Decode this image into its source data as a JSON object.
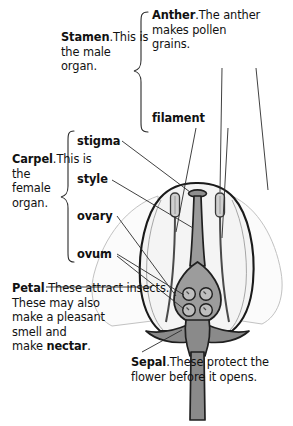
{
  "diagram": {
    "colors": {
      "outline": "#1a1a1a",
      "petal_fill": "#f2f2f2",
      "outer_petal": "#d8d8d8",
      "receptacle": "#8c8c8c",
      "ovary": "#9a9a9a",
      "ovule": "#8a8a8a",
      "anther": "#c9c9c9",
      "leader": "#2b2b2b",
      "background": "#ffffff"
    }
  },
  "labels": {
    "stamen": {
      "term": "Stamen",
      "punct": ".",
      "body": "This is\nthe male\norgan."
    },
    "anther": {
      "term": "Anther",
      "punct": ".",
      "body": "The anther\nmakes pollen\ngrains."
    },
    "filament": {
      "term": "filament"
    },
    "carpel": {
      "term": "Carpel",
      "punct": ".",
      "body": "This is\nthe\nfemale\norgan."
    },
    "stigma": {
      "term": "stigma"
    },
    "style": {
      "term": "style"
    },
    "ovary": {
      "term": "ovary"
    },
    "ovum": {
      "term": "ovum"
    },
    "petal": {
      "term": "Petal",
      "punct": ".",
      "body_pre": "These attract insects.\nThese may also\nmake a pleasant\nsmell and\nmake ",
      "body_bold": "nectar",
      "body_post": "."
    },
    "sepal": {
      "term": "Sepal",
      "punct": ".",
      "body": "These protect the\nflower before it opens."
    }
  },
  "braces": [
    {
      "name": "stamen-brace"
    },
    {
      "name": "carpel-brace"
    }
  ],
  "parts": [
    {
      "name": "anther-left"
    },
    {
      "name": "anther-right"
    },
    {
      "name": "filament-left"
    },
    {
      "name": "filament-right"
    },
    {
      "name": "stigma"
    },
    {
      "name": "style"
    },
    {
      "name": "ovary"
    },
    {
      "name": "ovule",
      "count": 4
    },
    {
      "name": "petal-cup"
    },
    {
      "name": "outer-petal-left"
    },
    {
      "name": "outer-petal-right"
    },
    {
      "name": "sepal-left"
    },
    {
      "name": "sepal-right"
    },
    {
      "name": "receptacle"
    },
    {
      "name": "stem"
    }
  ]
}
